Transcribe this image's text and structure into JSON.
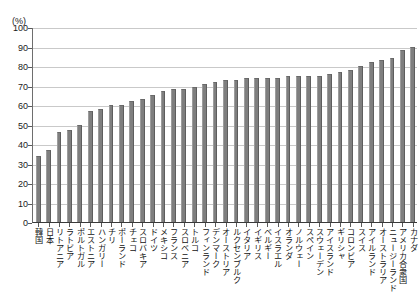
{
  "chart_data": {
    "type": "bar",
    "title": "",
    "subtitle": "",
    "xlabel": "",
    "ylabel": "(%)",
    "unit_label": "(%)",
    "ylim": [
      0,
      100
    ],
    "ytick_step": 10,
    "grid": true,
    "legend": "none",
    "orientation": "vertical",
    "bar_color": "#7f7f7f",
    "gridline_color": "#c9c9c9",
    "axis_color": "#3a3a3a",
    "ytick_labels": [
      "0",
      "10",
      "20",
      "30",
      "40",
      "50",
      "60",
      "70",
      "80",
      "90",
      "100"
    ],
    "ytick_values": [
      0,
      10,
      20,
      30,
      40,
      50,
      60,
      70,
      80,
      90,
      100
    ],
    "categories": [
      "韓国",
      "日本",
      "リトアニア",
      "ラトビア",
      "ポルトガル",
      "エストニア",
      "ハンガリー",
      "チリ",
      "ポーランド",
      "チェコ",
      "スロバキア",
      "ドイツ",
      "メキシコ",
      "フランス",
      "スロベニア",
      "トルコ",
      "フィンランド",
      "デンマーク",
      "オーストリア",
      "ルクセンブルク",
      "イタリア",
      "イギリス",
      "ベルギー",
      "イスラエル",
      "オランダ",
      "ノルウェー",
      "スペイン",
      "スウェーデン",
      "アイスランド",
      "ギリシャ",
      "コロンビア",
      "スイス",
      "アイルランド",
      "オーストラリア",
      "ニュージーランド",
      "アメリカ合衆国",
      "カナダ"
    ],
    "values": [
      34,
      37,
      46,
      47,
      50,
      57,
      58,
      60,
      60,
      62,
      63,
      65,
      67,
      68,
      68,
      69,
      71,
      72,
      73,
      73,
      74,
      74,
      74,
      74,
      75,
      75,
      75,
      75,
      76,
      77,
      78,
      80,
      82,
      83,
      84,
      88,
      90
    ]
  }
}
